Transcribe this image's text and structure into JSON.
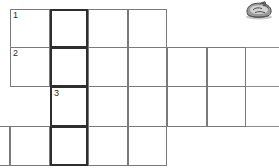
{
  "puzzle": {
    "title": "crossword-grid",
    "numbers": [
      {
        "label": "1",
        "row": 1,
        "col": 1
      },
      {
        "label": "2",
        "row": 2,
        "col": 1
      },
      {
        "label": "3",
        "row": 3,
        "col": 2
      }
    ],
    "grid": {
      "rows": 4,
      "cell_size": 39,
      "row_edges": [
        9,
        48,
        87,
        127,
        166
      ],
      "col_edges": [
        10,
        50,
        88,
        128,
        167,
        207,
        246
      ],
      "rows_spans": [
        {
          "row": 1,
          "first_col": 1,
          "last_col": 4
        },
        {
          "row": 2,
          "first_col": 1,
          "last_col": 6
        },
        {
          "row": 3,
          "first_col": 2,
          "last_col": 6
        },
        {
          "row": 4,
          "first_col": 0,
          "last_col": 4
        }
      ],
      "highlight_column": 2
    },
    "colors": {
      "cell_border": "#7a7a7a",
      "bold_border": "#2e2e2e",
      "rule": "#8d8d8d",
      "cell_fill": "#ffffff",
      "number_text": "#2b2b2b",
      "background": "#ffffff"
    }
  },
  "decoration": {
    "name": "clipart-graphic",
    "description": "small grayscale clip-art illustration",
    "colors": {
      "dark": "#4a4a4a",
      "mid": "#8a8a8a",
      "light": "#bdbdbd"
    }
  }
}
